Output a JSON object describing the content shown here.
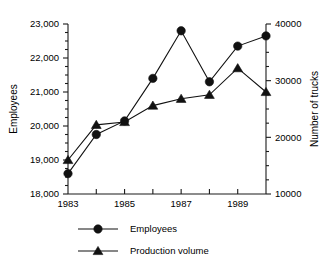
{
  "chart_data": {
    "type": "line",
    "title": "",
    "xlabel": "",
    "x": [
      1983,
      1984,
      1985,
      1986,
      1987,
      1988,
      1989,
      1990
    ],
    "xtick_labels": [
      "1983",
      "",
      "1985",
      "",
      "1987",
      "",
      "1989",
      ""
    ],
    "xlim": [
      1983,
      1990
    ],
    "grid": false,
    "legend_position": "bottom",
    "axes": [
      {
        "id": "left",
        "label": "Employees",
        "lim": [
          18000,
          23000
        ],
        "ticks": [
          18000,
          19000,
          20000,
          21000,
          22000,
          23000
        ],
        "tick_labels": [
          "18,000",
          "19,000",
          "20,000",
          "21,000",
          "22,000",
          "23,000"
        ],
        "minor_tick_step": 250
      },
      {
        "id": "right",
        "label": "Number of trucks",
        "lim": [
          10000,
          40000
        ],
        "ticks": [
          10000,
          20000,
          30000,
          40000
        ],
        "tick_labels": [
          "10000",
          "20000",
          "30000",
          "40000"
        ],
        "minor_tick_step": 2500
      }
    ],
    "series": [
      {
        "name": "Employees",
        "axis": "left",
        "marker": "circle",
        "values": [
          18600,
          19750,
          20150,
          21400,
          22800,
          21300,
          22350,
          22650
        ]
      },
      {
        "name": "Production volume",
        "axis": "right",
        "marker": "triangle",
        "values": [
          16000,
          22200,
          22700,
          25600,
          26800,
          27500,
          32200,
          28000
        ]
      }
    ]
  },
  "legend": {
    "entries": [
      {
        "label": "Employees",
        "marker": "circle"
      },
      {
        "label": "Production volume",
        "marker": "triangle"
      }
    ]
  }
}
